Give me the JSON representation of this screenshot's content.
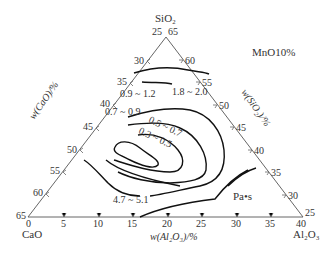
{
  "diagram": {
    "title": "MnO10%",
    "unit": "Pa•s",
    "vertices": {
      "top": {
        "name": "SiO₂",
        "left_val": "25",
        "right_val": "65"
      },
      "left": {
        "name": "CaO",
        "left_val": "65",
        "bottom_val": "0"
      },
      "right": {
        "name": "Al₂O₃",
        "right_val": "25",
        "bottom_val": "40"
      }
    },
    "axes": {
      "left": {
        "label": "w(CaO)/%",
        "ticks": [
          "30",
          "35",
          "40",
          "45",
          "50",
          "55",
          "60"
        ]
      },
      "right": {
        "label": "w(SiO₂)/%",
        "ticks": [
          "60",
          "55",
          "50",
          "45",
          "40",
          "35",
          "30"
        ]
      },
      "bottom": {
        "label": "w(Al₂O₃)/%",
        "ticks": [
          "5",
          "10",
          "15",
          "20",
          "25",
          "30",
          "35"
        ]
      }
    },
    "contour_labels": [
      {
        "text": "0.9 ~ 1.2",
        "x": 126,
        "y": 97
      },
      {
        "text": "1.8 ~ 2.0",
        "x": 178,
        "y": 95
      },
      {
        "text": "0.7 ~ 0.9",
        "x": 104,
        "y": 110
      },
      {
        "text": "0.5 ~ 0.7",
        "x": 148,
        "y": 122
      },
      {
        "text": "0.3 ~ 0.5",
        "x": 138,
        "y": 133
      },
      {
        "text": "4.7 ~ 5.1",
        "x": 115,
        "y": 202
      }
    ]
  }
}
